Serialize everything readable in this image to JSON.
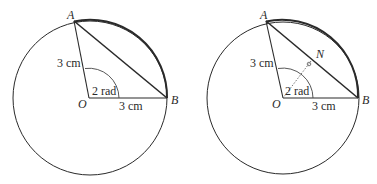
{
  "figures": [
    {
      "id": "left",
      "center": {
        "x": 90,
        "y": 98
      },
      "radius": 77,
      "points": {
        "A": {
          "x": 74,
          "y": 21,
          "label": "A"
        },
        "B": {
          "x": 167,
          "y": 98,
          "label": "B"
        },
        "O": {
          "x": 89,
          "y": 98,
          "label": "O"
        }
      },
      "labels": {
        "radius_OA": "3 cm",
        "radius_OB": "3 cm",
        "angle": "2 rad"
      }
    },
    {
      "id": "right",
      "center": {
        "x": 283,
        "y": 98
      },
      "radius": 76,
      "points": {
        "A": {
          "x": 266,
          "y": 21,
          "label": "A"
        },
        "B": {
          "x": 358,
          "y": 98,
          "label": "B"
        },
        "O": {
          "x": 283,
          "y": 98,
          "label": "O"
        },
        "N": {
          "x": 311,
          "y": 61,
          "label": "N"
        }
      },
      "labels": {
        "radius_OA": "3 cm",
        "radius_OB": "3 cm",
        "angle": "2 rad"
      }
    }
  ],
  "colors": {
    "line": "#2a2a2a",
    "dotted": "#555555",
    "background": "#ffffff"
  }
}
